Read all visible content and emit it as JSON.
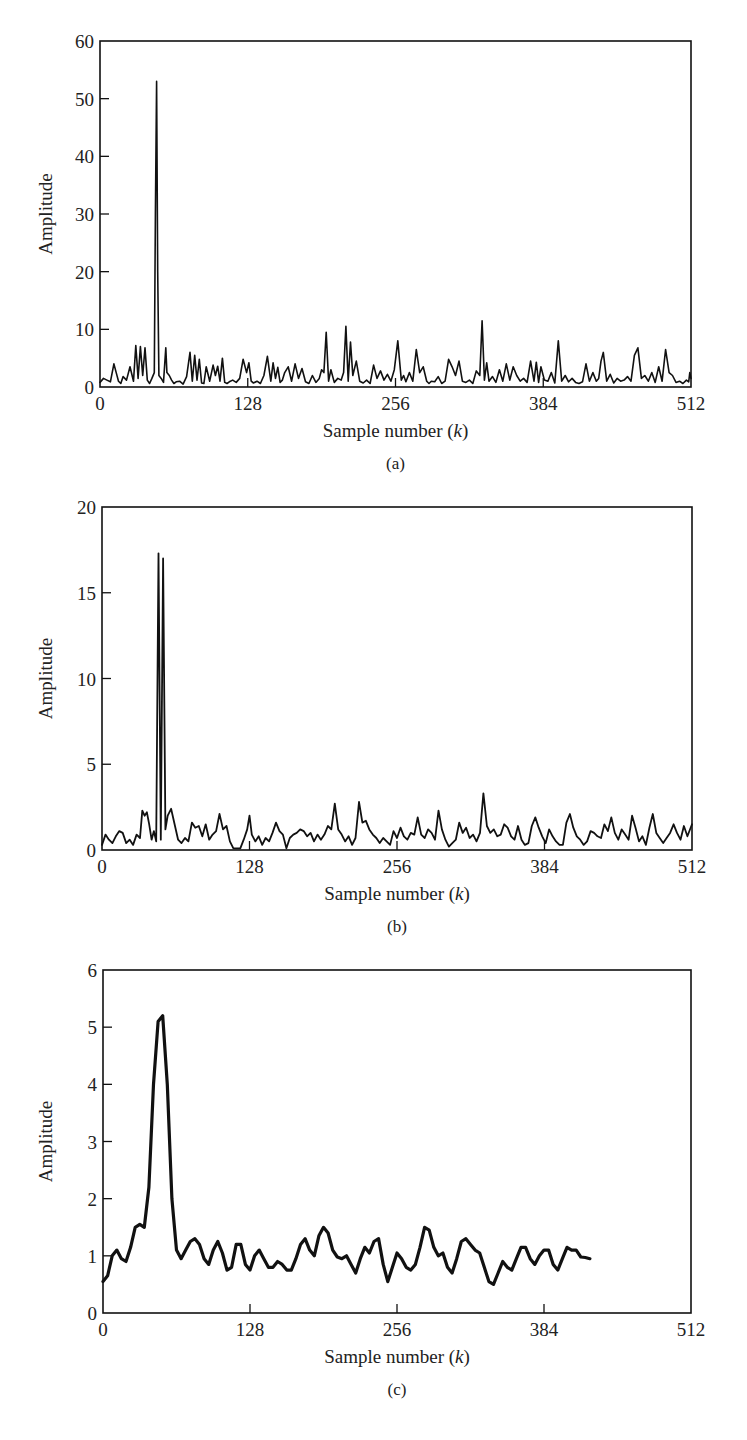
{
  "figure": {
    "panels": [
      {
        "id": "a",
        "caption": "(a)",
        "ylabel": "Amplitude",
        "xlabel": "Sample number (k)",
        "xlabel_main": "Sample number (",
        "xlabel_var": "k",
        "xlabel_end": ")"
      },
      {
        "id": "b",
        "caption": "(b)",
        "ylabel": "Amplitude",
        "xlabel": "Sample number (k)",
        "xlabel_main": "Sample number (",
        "xlabel_var": "k",
        "xlabel_end": ")"
      },
      {
        "id": "c",
        "caption": "(c)",
        "ylabel": "Amplitude",
        "xlabel": "Sample number (k)",
        "xlabel_main": "Sample number (",
        "xlabel_var": "k",
        "xlabel_end": ")"
      }
    ]
  },
  "chart_data": [
    {
      "type": "line",
      "title": "(a)",
      "xlabel": "Sample number (k)",
      "ylabel": "Amplitude",
      "xlim": [
        0,
        512
      ],
      "ylim": [
        0,
        60
      ],
      "xticks": [
        0,
        128,
        256,
        384,
        512
      ],
      "yticks": [
        0,
        10,
        20,
        30,
        40,
        50,
        60
      ],
      "grid": false,
      "legend": null,
      "description": "Raw periodogram: very spiky, dominant peak ~53 at k~49, other spikes up to ~11",
      "series": [
        {
          "name": "amplitude",
          "x": [
            0,
            3,
            6,
            9,
            12,
            14,
            16,
            18,
            20,
            23,
            26,
            29,
            31,
            33,
            35,
            37,
            39,
            41,
            43,
            45,
            47,
            48,
            49,
            50,
            51,
            53,
            55,
            57,
            58,
            60,
            62,
            64,
            66,
            69,
            72,
            75,
            78,
            80,
            82,
            84,
            86,
            88,
            90,
            92,
            95,
            98,
            100,
            102,
            104,
            106,
            108,
            110,
            112,
            115,
            118,
            121,
            124,
            127,
            129,
            131,
            133,
            136,
            139,
            142,
            145,
            148,
            150,
            152,
            154,
            156,
            158,
            160,
            163,
            166,
            169,
            172,
            175,
            178,
            181,
            184,
            187,
            190,
            192,
            194,
            196,
            198,
            200,
            203,
            206,
            209,
            211,
            213,
            215,
            217,
            219,
            222,
            225,
            228,
            231,
            234,
            237,
            240,
            243,
            246,
            249,
            252,
            255,
            258,
            261,
            263,
            265,
            268,
            271,
            274,
            277,
            280,
            283,
            285,
            287,
            290,
            293,
            296,
            299,
            302,
            305,
            308,
            311,
            314,
            317,
            320,
            323,
            326,
            329,
            331,
            333,
            335,
            337,
            340,
            343,
            346,
            349,
            352,
            355,
            358,
            361,
            364,
            367,
            370,
            373,
            376,
            378,
            380,
            382,
            385,
            388,
            391,
            394,
            397,
            400,
            403,
            406,
            409,
            412,
            415,
            418,
            421,
            424,
            427,
            430,
            432,
            434,
            436,
            439,
            442,
            445,
            448,
            451,
            454,
            457,
            460,
            463,
            466,
            469,
            472,
            475,
            478,
            481,
            484,
            487,
            490,
            493,
            496,
            499,
            502,
            505,
            508,
            510,
            511,
            512
          ],
          "y": [
            0.8,
            1.5,
            1.2,
            0.9,
            4.0,
            2.5,
            1.0,
            0.6,
            1.8,
            1.2,
            3.5,
            1.0,
            7.2,
            1.5,
            7.0,
            2.0,
            6.8,
            1.2,
            0.6,
            1.5,
            2.5,
            30,
            53,
            20,
            2.0,
            1.5,
            0.8,
            6.8,
            2.5,
            2.0,
            1.2,
            0.6,
            0.9,
            1.0,
            0.5,
            1.8,
            6.0,
            1.0,
            5.5,
            1.2,
            4.8,
            0.7,
            0.6,
            3.5,
            1.0,
            3.8,
            2.0,
            3.6,
            1.0,
            5.0,
            0.8,
            0.6,
            0.9,
            1.2,
            0.8,
            1.5,
            4.8,
            2.5,
            4.2,
            1.0,
            0.7,
            1.0,
            0.6,
            2.0,
            5.3,
            1.0,
            4.2,
            1.5,
            3.4,
            0.8,
            1.2,
            2.5,
            3.5,
            1.0,
            4.0,
            1.5,
            3.2,
            0.9,
            0.6,
            2.0,
            0.8,
            1.5,
            3.0,
            2.5,
            9.5,
            1.0,
            3.0,
            0.8,
            1.5,
            1.2,
            2.5,
            10.5,
            1.0,
            7.8,
            2.0,
            4.5,
            1.0,
            0.7,
            1.2,
            0.6,
            3.8,
            1.5,
            2.8,
            1.2,
            2.2,
            1.0,
            3.0,
            8.0,
            1.2,
            2.0,
            0.9,
            2.5,
            1.0,
            6.5,
            2.5,
            3.5,
            1.0,
            0.6,
            1.0,
            0.9,
            1.8,
            0.6,
            1.0,
            4.8,
            3.5,
            2.0,
            4.5,
            1.0,
            0.8,
            1.2,
            0.6,
            2.8,
            2.0,
            11.5,
            1.2,
            4.2,
            1.0,
            1.8,
            0.8,
            3.0,
            1.0,
            4.0,
            1.2,
            3.5,
            2.0,
            1.0,
            1.5,
            0.8,
            4.5,
            1.0,
            4.3,
            0.8,
            3.5,
            1.2,
            1.0,
            2.5,
            0.7,
            8.0,
            1.0,
            2.0,
            0.9,
            1.5,
            0.8,
            0.6,
            0.9,
            4.0,
            1.0,
            2.5,
            1.0,
            1.5,
            4.5,
            6.0,
            1.0,
            2.2,
            0.7,
            1.5,
            1.0,
            1.2,
            1.8,
            1.0,
            5.5,
            6.8,
            1.5,
            2.0,
            1.0,
            2.5,
            0.8,
            3.5,
            1.0,
            6.5,
            2.5,
            2.0,
            0.8,
            1.0,
            0.6,
            1.2,
            0.9,
            2.5,
            1.5,
            2.0,
            1.2,
            5.0,
            0.8,
            3.0,
            1.0,
            3.5,
            2.5,
            4.8,
            2.0
          ]
        }
      ]
    },
    {
      "type": "line",
      "title": "(b)",
      "xlabel": "Sample number (k)",
      "ylabel": "Amplitude",
      "xlim": [
        0,
        512
      ],
      "ylim": [
        0,
        20
      ],
      "xticks": [
        0,
        128,
        256,
        384,
        512
      ],
      "yticks": [
        0,
        5,
        10,
        15,
        20
      ],
      "grid": false,
      "legend": null,
      "description": "Moderately smoothed spectrum: peak ~17.3 at k~47, background ~0.5-3.3",
      "series": [
        {
          "name": "amplitude",
          "x": [
            0,
            3,
            6,
            9,
            12,
            15,
            18,
            21,
            24,
            27,
            30,
            33,
            35,
            37,
            39,
            41,
            43,
            45,
            47,
            49,
            51,
            53,
            55,
            57,
            60,
            63,
            66,
            69,
            72,
            75,
            78,
            81,
            84,
            87,
            90,
            93,
            96,
            99,
            102,
            105,
            108,
            111,
            114,
            117,
            120,
            123,
            126,
            128,
            130,
            133,
            136,
            139,
            142,
            145,
            148,
            151,
            154,
            157,
            160,
            163,
            166,
            169,
            172,
            175,
            178,
            181,
            184,
            187,
            190,
            193,
            196,
            199,
            202,
            205,
            208,
            211,
            214,
            217,
            220,
            223,
            226,
            229,
            232,
            235,
            238,
            241,
            244,
            247,
            250,
            253,
            256,
            259,
            262,
            265,
            268,
            271,
            274,
            277,
            280,
            283,
            286,
            289,
            292,
            295,
            298,
            301,
            304,
            307,
            310,
            313,
            316,
            319,
            322,
            325,
            328,
            331,
            334,
            337,
            340,
            343,
            346,
            349,
            352,
            355,
            358,
            361,
            364,
            367,
            370,
            373,
            376,
            379,
            382,
            385,
            388,
            391,
            394,
            397,
            400,
            403,
            406,
            409,
            412,
            415,
            418,
            421,
            424,
            427,
            430,
            433,
            436,
            439,
            442,
            445,
            448,
            451,
            454,
            457,
            460,
            463,
            466,
            469,
            472,
            475,
            478,
            481,
            484,
            487,
            490,
            493,
            496,
            499,
            502,
            505,
            508,
            512
          ],
          "y": [
            0.3,
            0.9,
            0.6,
            0.4,
            0.8,
            1.1,
            1.0,
            0.4,
            0.6,
            0.3,
            0.9,
            0.7,
            2.3,
            2.0,
            2.2,
            1.5,
            0.6,
            1.1,
            0.5,
            17.3,
            0.6,
            17.0,
            1.2,
            2.0,
            2.4,
            1.5,
            0.6,
            0.4,
            0.7,
            0.5,
            1.6,
            1.3,
            1.4,
            0.8,
            1.5,
            0.6,
            0.9,
            1.1,
            2.1,
            1.2,
            1.4,
            0.5,
            0.1,
            0.1,
            0.1,
            0.6,
            1.2,
            2.0,
            0.9,
            0.5,
            0.8,
            0.3,
            0.7,
            0.5,
            1.0,
            1.6,
            1.1,
            0.9,
            0.1,
            0.7,
            0.9,
            1.0,
            1.2,
            1.1,
            0.8,
            1.0,
            0.5,
            0.9,
            0.6,
            0.9,
            1.4,
            1.2,
            2.7,
            1.2,
            0.9,
            0.5,
            0.8,
            0.3,
            0.7,
            2.8,
            1.6,
            1.7,
            1.2,
            0.9,
            0.7,
            0.4,
            0.7,
            0.5,
            0.3,
            1.1,
            0.7,
            1.3,
            0.8,
            0.6,
            1.0,
            0.9,
            1.9,
            0.9,
            0.7,
            1.2,
            1.0,
            0.6,
            2.3,
            1.2,
            0.6,
            0.2,
            0.4,
            0.6,
            1.6,
            1.0,
            1.3,
            0.7,
            0.9,
            0.5,
            1.0,
            3.3,
            1.4,
            1.0,
            1.2,
            0.8,
            0.9,
            1.5,
            1.3,
            0.8,
            0.6,
            1.4,
            0.6,
            0.3,
            0.4,
            1.4,
            1.9,
            1.3,
            0.8,
            0.4,
            1.2,
            0.8,
            0.5,
            0.3,
            0.3,
            1.6,
            2.1,
            1.3,
            0.8,
            0.6,
            0.3,
            0.5,
            1.1,
            1.0,
            0.8,
            0.7,
            1.5,
            1.1,
            1.9,
            1.0,
            0.6,
            1.2,
            0.9,
            0.6,
            2.0,
            1.3,
            0.5,
            0.8,
            0.3,
            1.3,
            2.1,
            1.0,
            0.7,
            0.4,
            0.7,
            1.0,
            1.5,
            1.0,
            0.6,
            1.4,
            0.8,
            1.5
          ]
        }
      ]
    },
    {
      "type": "line",
      "title": "(c)",
      "xlabel": "Sample number (k)",
      "ylabel": "Amplitude",
      "xlim": [
        0,
        512
      ],
      "ylim": [
        0,
        6
      ],
      "xticks": [
        0,
        128,
        256,
        384,
        512
      ],
      "yticks": [
        0,
        1,
        2,
        3,
        4,
        5,
        6
      ],
      "grid": false,
      "legend": null,
      "description": "Heavily smoothed spectrum: single broad peak ~5.25 at k~49, background oscillating 0.5-1.5",
      "series": [
        {
          "name": "amplitude",
          "x": [
            0,
            4,
            8,
            12,
            16,
            20,
            24,
            28,
            32,
            36,
            40,
            44,
            48,
            52,
            56,
            60,
            64,
            68,
            72,
            76,
            80,
            84,
            88,
            92,
            96,
            100,
            104,
            108,
            112,
            116,
            120,
            124,
            128,
            132,
            136,
            140,
            144,
            148,
            152,
            156,
            160,
            164,
            168,
            172,
            176,
            180,
            184,
            188,
            192,
            196,
            200,
            204,
            208,
            212,
            216,
            220,
            224,
            228,
            232,
            236,
            240,
            244,
            248,
            252,
            256,
            260,
            264,
            268,
            272,
            276,
            280,
            284,
            288,
            292,
            296,
            300,
            304,
            308,
            312,
            316,
            320,
            324,
            328,
            332,
            336,
            340,
            344,
            348,
            352,
            356,
            360,
            364,
            368,
            372,
            376,
            380,
            384,
            388,
            392,
            396,
            400,
            404,
            408,
            412,
            416,
            420,
            424,
            428,
            432,
            436,
            440,
            444,
            448,
            452,
            456,
            460,
            464,
            468,
            472,
            476,
            480,
            484,
            488,
            492,
            496,
            500,
            504,
            508,
            512
          ],
          "y": [
            0.55,
            0.65,
            1.0,
            1.1,
            0.95,
            0.9,
            1.15,
            1.5,
            1.55,
            1.5,
            2.2,
            4.0,
            5.1,
            5.2,
            4.0,
            2.0,
            1.1,
            0.95,
            1.1,
            1.25,
            1.3,
            1.2,
            0.95,
            0.85,
            1.1,
            1.25,
            1.05,
            0.75,
            0.8,
            1.2,
            1.2,
            0.85,
            0.75,
            1.0,
            1.1,
            0.95,
            0.8,
            0.8,
            0.9,
            0.85,
            0.75,
            0.75,
            0.95,
            1.2,
            1.3,
            1.1,
            1.0,
            1.35,
            1.5,
            1.4,
            1.1,
            0.98,
            0.95,
            1.0,
            0.85,
            0.7,
            0.95,
            1.15,
            1.05,
            1.25,
            1.3,
            0.85,
            0.55,
            0.8,
            1.05,
            0.95,
            0.8,
            0.75,
            0.85,
            1.15,
            1.5,
            1.45,
            1.15,
            1.0,
            1.05,
            0.8,
            0.7,
            0.95,
            1.25,
            1.3,
            1.2,
            1.1,
            1.05,
            0.8,
            0.55,
            0.5,
            0.7,
            0.9,
            0.8,
            0.75,
            0.95,
            1.15,
            1.15,
            0.95,
            0.85,
            1.0,
            1.1,
            1.1,
            0.85,
            0.75,
            0.95,
            1.15,
            1.1,
            1.1,
            0.98,
            0.97,
            0.95
          ]
        }
      ]
    }
  ]
}
